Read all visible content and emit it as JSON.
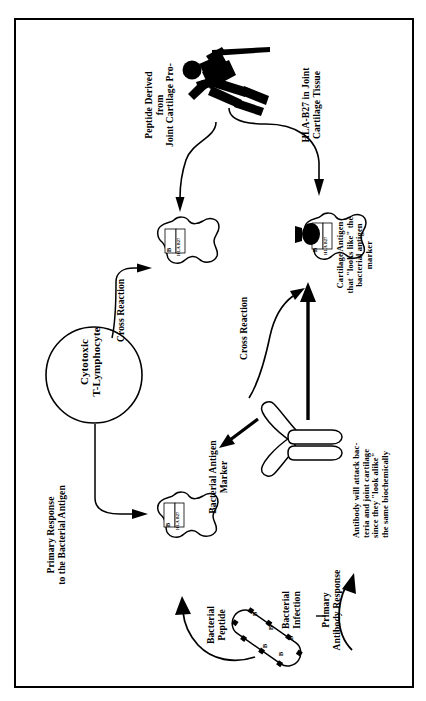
{
  "diagram": {
    "orientation": "rotated-90-ccw",
    "labels": {
      "peptide_derived": "Peptide Derived\nfrom\nJoint Cartilage Pro-",
      "hla_joint_tissue": "HLA-B27 in Joint\nCartilage Tissue",
      "cross_reaction_top": "Cross Reaction",
      "cross_reaction_bottom": "Cross Reaction",
      "cartilage_antigen": "Cartilage Antigen\nthat \"looks like\" the\nbacterial antigen\nmarker",
      "cytotoxic_t": "Cytotoxic\nT-Lymphocyte",
      "primary_response": "Primary Response\nto the Bacterial Antigen",
      "bacterial_antigen_marker": "Bacterial Antigen\nMarker",
      "antibody_note": "Antibody will attack bac-\nteria and joint cartilage\nsince they \"look alike\"\nthe same biochemically",
      "bacterial_peptide": "Bacterial\nPeptide",
      "bacterial_infection": "Bacterial\nInfection",
      "primary_antibody_response": "Primary\nAntibody Response"
    },
    "cell_markers": {
      "b_marker": "B",
      "hla_marker": "HLA B27"
    },
    "bacterium_markers": [
      "B",
      "B",
      "B",
      "B",
      "B",
      "B",
      "B",
      "B"
    ],
    "colors": {
      "ink": "#000000",
      "paper": "#ffffff"
    },
    "figures": {
      "person": "falling-person-pictogram",
      "antibody": "y-shaped-antibody",
      "bacterium": "rod-shaped-bacterium",
      "lymphocyte": "circle-cell"
    }
  }
}
